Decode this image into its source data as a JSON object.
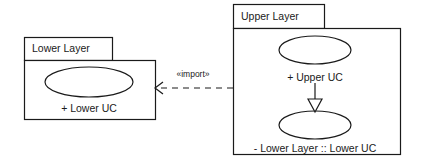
{
  "diagram": {
    "type": "uml-package-diagram",
    "background_color": "#ffffff",
    "stroke_color": "#1a1a1a",
    "text_color": "#1a1a1a"
  },
  "packages": [
    {
      "id": "lower-layer",
      "name": "Lower Layer",
      "tab": {
        "x": 24,
        "y": 37,
        "width": 88,
        "height": 23
      },
      "body": {
        "x": 24,
        "y": 60,
        "width": 131,
        "height": 60
      },
      "use_cases": [
        {
          "id": "lower-uc",
          "name": "+ Lower UC",
          "visibility": "+",
          "ellipse": {
            "cx": 89,
            "cy": 82,
            "rx": 44,
            "ry": 15
          },
          "label_x": 89,
          "label_y": 109
        }
      ]
    },
    {
      "id": "upper-layer",
      "name": "Upper Layer",
      "tab": {
        "x": 233,
        "y": 4,
        "width": 91,
        "height": 24
      },
      "body": {
        "x": 233,
        "y": 28,
        "width": 168,
        "height": 127
      },
      "use_cases": [
        {
          "id": "upper-uc",
          "name": "+ Upper UC",
          "visibility": "+",
          "ellipse": {
            "cx": 315,
            "cy": 50,
            "rx": 36,
            "ry": 14
          },
          "label_x": 315,
          "label_y": 78
        },
        {
          "id": "imported-lower-uc",
          "name": "- Lower Layer :: Lower UC",
          "visibility": "-",
          "ellipse": {
            "cx": 315,
            "cy": 125,
            "rx": 36,
            "ry": 14
          },
          "label_x": 315,
          "label_y": 149
        }
      ]
    }
  ],
  "relationships": [
    {
      "id": "import-dependency",
      "kind": "import",
      "stereotype": "«import»",
      "line_style": "dashed",
      "arrow_head": "open",
      "from": "upper-layer",
      "to": "lower-layer",
      "start": {
        "x": 233,
        "y": 88
      },
      "end": {
        "x": 155,
        "y": 88
      },
      "label_x": 193,
      "label_y": 73
    },
    {
      "id": "generalization",
      "kind": "generalization",
      "stereotype": "",
      "line_style": "solid",
      "arrow_head": "hollow-triangle",
      "from": "upper-uc",
      "to": "imported-lower-uc",
      "start": {
        "x": 315,
        "y": 83
      },
      "end": {
        "x": 315,
        "y": 111
      }
    }
  ]
}
